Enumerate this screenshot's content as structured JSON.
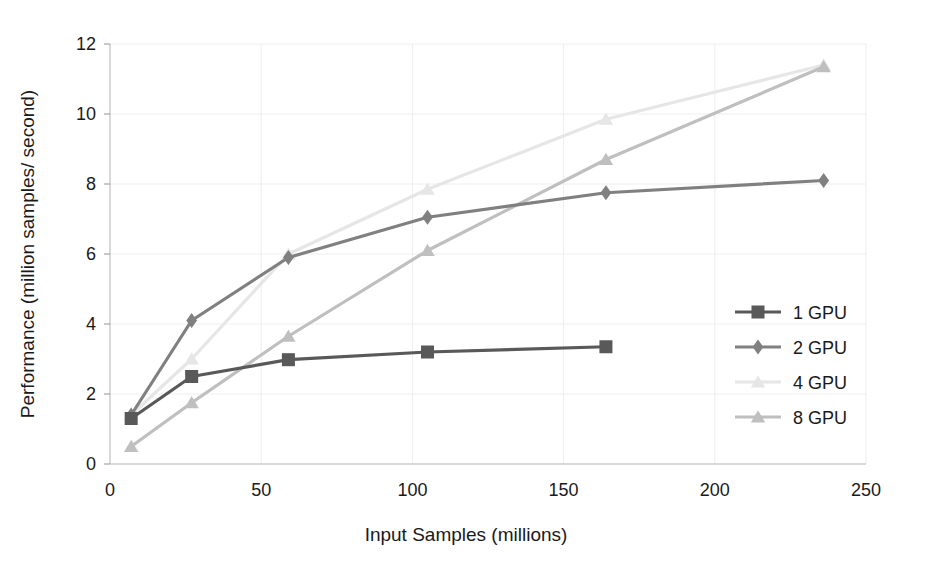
{
  "chart_data": {
    "type": "line",
    "title": "",
    "xlabel": "Input Samples (millions)",
    "ylabel": "Performance (million samples/ second)",
    "xlim": [
      0,
      250
    ],
    "ylim": [
      0,
      12
    ],
    "xticks": [
      0,
      50,
      100,
      150,
      200,
      250
    ],
    "yticks": [
      0,
      2,
      4,
      6,
      8,
      10,
      12
    ],
    "xtick_labels": [
      "0",
      "50",
      "100",
      "150",
      "200",
      "250"
    ],
    "ytick_labels": [
      "0",
      "2",
      "4",
      "6",
      "8",
      "10",
      "12"
    ],
    "grid": true,
    "legend_position": "right",
    "series": [
      {
        "name": "1 GPU",
        "color": "#595959",
        "marker": "square",
        "x": [
          7,
          27,
          59,
          105,
          164
        ],
        "values": [
          1.3,
          2.5,
          2.98,
          3.2,
          3.35
        ]
      },
      {
        "name": "2 GPU",
        "color": "#808080",
        "marker": "diamond",
        "x": [
          7,
          27,
          59,
          105,
          164,
          236
        ],
        "values": [
          1.4,
          4.1,
          5.9,
          7.05,
          7.75,
          8.1
        ]
      },
      {
        "name": "4 GPU",
        "color": "#e6e6e6",
        "marker": "triangle",
        "x": [
          7,
          27,
          59,
          105,
          164,
          236
        ],
        "values": [
          1.4,
          3.0,
          6.0,
          7.85,
          9.85,
          11.4
        ]
      },
      {
        "name": "8 GPU",
        "color": "#bfbfbf",
        "marker": "triangle",
        "x": [
          7,
          27,
          59,
          105,
          164,
          236
        ],
        "values": [
          0.5,
          1.75,
          3.65,
          6.1,
          8.7,
          11.35
        ]
      }
    ]
  },
  "legend": {
    "items": [
      {
        "label": "1 GPU",
        "color": "#595959",
        "marker": "square"
      },
      {
        "label": "2 GPU",
        "color": "#808080",
        "marker": "diamond"
      },
      {
        "label": "4 GPU",
        "color": "#e6e6e6",
        "marker": "triangle"
      },
      {
        "label": "8 GPU",
        "color": "#bfbfbf",
        "marker": "triangle"
      }
    ]
  }
}
